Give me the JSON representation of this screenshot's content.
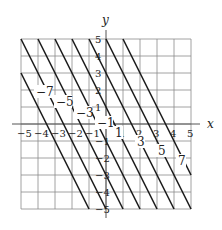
{
  "diagram": {
    "title": "",
    "axes": {
      "x_label": "x",
      "y_label": "y",
      "x_range": [
        -5,
        5
      ],
      "y_range": [
        -5,
        5
      ]
    },
    "x_ticks": [
      "−5",
      "−4",
      "−3",
      "−2",
      "−1",
      "1",
      "2",
      "3",
      "4",
      "5"
    ],
    "y_ticks": [
      "5",
      "4",
      "3",
      "2",
      "1",
      "−1",
      "−2",
      "−3",
      "−4",
      "−5"
    ],
    "lines": {
      "equation": "y = -2x + c",
      "c_values": [
        -7,
        -5,
        -3,
        -1,
        1,
        3,
        5,
        7
      ],
      "labels": [
        "−7",
        "−5",
        "−3",
        "−1",
        "1",
        "3",
        "5",
        "7"
      ]
    }
  }
}
